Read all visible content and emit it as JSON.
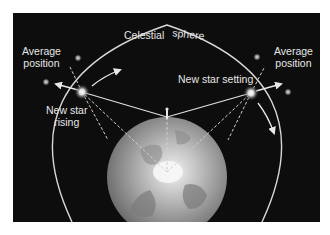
{
  "diagram": {
    "sphere_label_left": "Celestial",
    "sphere_label_right": "sphere",
    "left": {
      "average_label_line1": "Average",
      "average_label_line2": "position",
      "star_label_line1": "New star",
      "star_label_line2": "rising"
    },
    "right": {
      "average_label_line1": "Average",
      "average_label_line2": "position",
      "star_label": "New star setting"
    },
    "colors": {
      "background": "#0d0d0d",
      "line": "#e0e0e0",
      "earth_light": "#d8d8d8",
      "earth_dark": "#6e6e6e",
      "text": "#e6e6e6"
    }
  }
}
